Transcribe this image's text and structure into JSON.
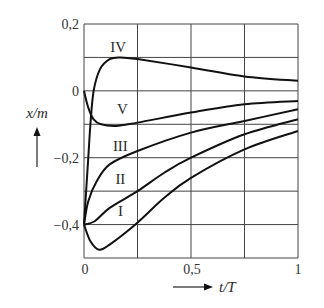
{
  "chart_data": {
    "type": "line",
    "title": "",
    "xlabel": "t/T",
    "ylabel": "x/m",
    "xlim": [
      0,
      1
    ],
    "ylim": [
      -0.5,
      0.2
    ],
    "grid": true,
    "x_ticks": [
      "0",
      "0,5",
      "1"
    ],
    "y_ticks": [
      "0,2",
      "0",
      "-0,2",
      "-0,4"
    ],
    "x_gridlines": [
      0,
      0.25,
      0.5,
      0.75,
      1
    ],
    "y_gridlines": [
      0.2,
      0.1,
      0,
      -0.1,
      -0.2,
      -0.3,
      -0.4,
      -0.5
    ],
    "series": [
      {
        "name": "I",
        "points": [
          [
            0,
            -0.4
          ],
          [
            0.03,
            -0.45
          ],
          [
            0.07,
            -0.475
          ],
          [
            0.12,
            -0.46
          ],
          [
            0.24,
            -0.4
          ],
          [
            0.375,
            -0.32
          ],
          [
            0.5,
            -0.26
          ],
          [
            0.75,
            -0.175
          ],
          [
            1,
            -0.12
          ]
        ]
      },
      {
        "name": "II",
        "points": [
          [
            0,
            -0.4
          ],
          [
            0.05,
            -0.39
          ],
          [
            0.12,
            -0.35
          ],
          [
            0.25,
            -0.3
          ],
          [
            0.375,
            -0.245
          ],
          [
            0.5,
            -0.2
          ],
          [
            0.75,
            -0.13
          ],
          [
            1,
            -0.085
          ]
        ]
      },
      {
        "name": "III",
        "points": [
          [
            0,
            -0.4
          ],
          [
            0.02,
            -0.33
          ],
          [
            0.06,
            -0.27
          ],
          [
            0.12,
            -0.22
          ],
          [
            0.25,
            -0.18
          ],
          [
            0.5,
            -0.125
          ],
          [
            0.75,
            -0.09
          ],
          [
            1,
            -0.055
          ]
        ]
      },
      {
        "name": "IV",
        "points": [
          [
            0,
            -0.4
          ],
          [
            0.02,
            -0.2
          ],
          [
            0.03,
            -0.1
          ],
          [
            0.045,
            0
          ],
          [
            0.075,
            0.065
          ],
          [
            0.12,
            0.095
          ],
          [
            0.17,
            0.1
          ],
          [
            0.25,
            0.095
          ],
          [
            0.5,
            0.07
          ],
          [
            0.75,
            0.043
          ],
          [
            1,
            0.03
          ]
        ]
      },
      {
        "name": "V",
        "points": [
          [
            0,
            0
          ],
          [
            0.02,
            -0.05
          ],
          [
            0.045,
            -0.085
          ],
          [
            0.08,
            -0.1
          ],
          [
            0.15,
            -0.105
          ],
          [
            0.25,
            -0.095
          ],
          [
            0.5,
            -0.065
          ],
          [
            0.75,
            -0.04
          ],
          [
            1,
            -0.03
          ]
        ]
      }
    ],
    "curve_labels": [
      {
        "text": "IV",
        "at": [
          0.16,
          0.13
        ]
      },
      {
        "text": "V",
        "at": [
          0.18,
          -0.055
        ]
      },
      {
        "text": "III",
        "at": [
          0.17,
          -0.165
        ]
      },
      {
        "text": "II",
        "at": [
          0.17,
          -0.265
        ]
      },
      {
        "text": "I",
        "at": [
          0.17,
          -0.36
        ]
      }
    ]
  },
  "labels": {
    "y_axis": "x/m",
    "x_axis": "t/T",
    "y_tick_0": "0,2",
    "y_tick_1": "0",
    "y_tick_2": "−0,2",
    "y_tick_3": "−0,4",
    "x_tick_0": "0",
    "x_tick_1": "0,5",
    "x_tick_2": "1"
  }
}
